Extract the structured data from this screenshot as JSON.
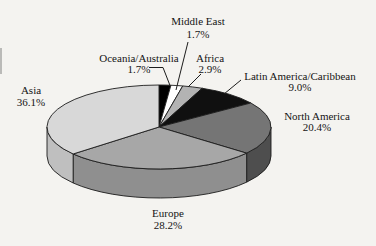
{
  "figure": {
    "background": "#f4f3f0",
    "stroke_color": "#1c1c1c",
    "text_color": "#141414",
    "font_size_px": 11
  },
  "chart_data": {
    "type": "pie",
    "style": "3d",
    "title": "",
    "unit": "%",
    "direction": "clockwise",
    "start_angle_deg": 0,
    "legend": "none (labels with leader lines around pie)",
    "slices": [
      {
        "label": "Oceania/Australia",
        "value": 1.7,
        "pct_text": "1.7%",
        "color_top": "#000000",
        "color_side": "#000000",
        "label_x": 139,
        "label_y1": 62,
        "label_y2": 72.5,
        "leader": [
          [
            149,
            67.5
          ],
          [
            163,
            67.5
          ],
          [
            170,
            85.5
          ]
        ]
      },
      {
        "label": "Middle East",
        "value": 1.7,
        "pct_text": "1.7%",
        "color_top": "#ffffff",
        "color_side": "#e6e6e6",
        "label_x": 198,
        "label_y1": 25,
        "label_y2": 37.5,
        "leader": [
          [
            188,
            42
          ],
          [
            176,
            90
          ]
        ]
      },
      {
        "label": "Africa",
        "value": 2.9,
        "pct_text": "2.9%",
        "color_top": "#b3b3b3",
        "color_side": "#999999",
        "label_x": 210,
        "label_y1": 61.5,
        "label_y2": 72.5,
        "leader": [
          [
            201,
            74
          ],
          [
            188,
            87
          ]
        ]
      },
      {
        "label": "Latin America/Caribbean",
        "value": 9.0,
        "pct_text": "9.0%",
        "color_top": "#101010",
        "color_side": "#000000",
        "label_x": 300,
        "label_y1": 79.5,
        "label_y2": 91,
        "leader": [
          [
            241,
            80
          ],
          [
            224,
            94
          ]
        ]
      },
      {
        "label": "North America",
        "value": 20.4,
        "pct_text": "20.4%",
        "color_top": "#757575",
        "color_side": "#4e4e4e",
        "label_x": 317,
        "label_y1": 119.5,
        "label_y2": 131,
        "leader": []
      },
      {
        "label": "Europe",
        "value": 28.2,
        "pct_text": "28.2%",
        "color_top": "#a7a7a7",
        "color_side": "#8f8f8f",
        "label_x": 168,
        "label_y1": 217,
        "label_y2": 229,
        "leader": []
      },
      {
        "label": "Asia",
        "value": 36.1,
        "pct_text": "36.1%",
        "color_top": "#d8d8d8",
        "color_side": "#bfbfbf",
        "label_x": 31,
        "label_y1": 94,
        "label_y2": 105.5,
        "leader": []
      }
    ],
    "layout": {
      "canvas_w": 376,
      "canvas_h": 246,
      "cx": 159,
      "cy": 127,
      "rx": 112,
      "ry": 42,
      "depth": 29
    }
  }
}
